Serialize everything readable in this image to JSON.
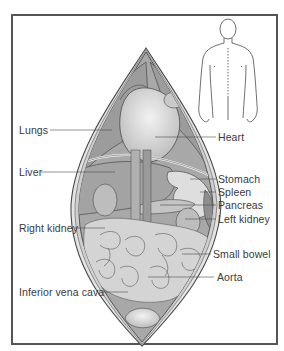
{
  "figure": {
    "type": "anatomical-illustration"
  },
  "colors": {
    "frame": "#555555",
    "outline": "#4a4a4a",
    "organ_dark": "#9a9a9a",
    "organ_mid": "#b8b8b8",
    "organ_light": "#d6d6d6",
    "organ_highlight": "#e8e8e8",
    "label_text": "#3a3a3a",
    "leader_line": "#4a4a4a"
  },
  "inset": {
    "name": "body-silhouette",
    "description": "human figure outline, back view, with dotted spine line"
  },
  "labels": {
    "left": [
      {
        "id": "lungs",
        "text": "Lungs"
      },
      {
        "id": "liver",
        "text": "Liver"
      },
      {
        "id": "right_kidney",
        "text": "Right kidney"
      },
      {
        "id": "inferior_vena_cava",
        "text": "Inferior vena cava"
      }
    ],
    "right": [
      {
        "id": "heart",
        "text": "Heart"
      },
      {
        "id": "stomach",
        "text": "Stomach"
      },
      {
        "id": "spleen",
        "text": "Spleen"
      },
      {
        "id": "pancreas",
        "text": "Pancreas"
      },
      {
        "id": "left_kidney",
        "text": "Left kidney"
      },
      {
        "id": "small_bowel",
        "text": "Small bowel"
      },
      {
        "id": "aorta",
        "text": "Aorta"
      }
    ]
  }
}
